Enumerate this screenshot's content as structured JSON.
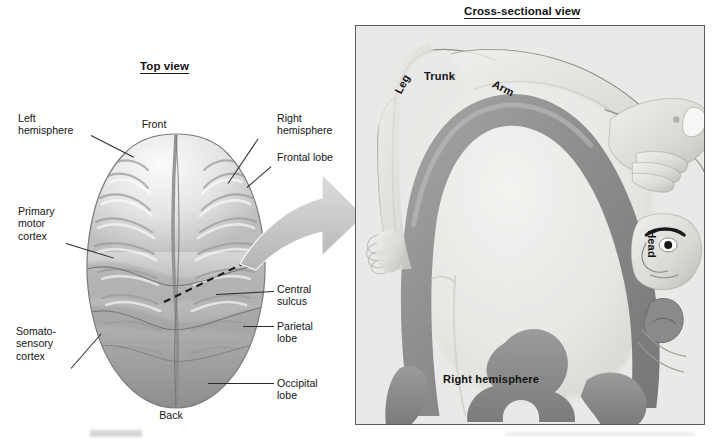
{
  "figure": {
    "kind": "anatomical-diagram"
  },
  "panels": {
    "top_view": {
      "title": "Top view",
      "orientation_labels": {
        "front": "Front",
        "back": "Back"
      },
      "callouts": [
        {
          "id": "left-hemisphere",
          "text": "Left\nhemisphere",
          "side": "left"
        },
        {
          "id": "primary-motor-cortex",
          "text": "Primary\nmotor\ncortex",
          "side": "left"
        },
        {
          "id": "somatosensory-cortex",
          "text": "Somato-\nsensory\ncortex",
          "side": "left"
        },
        {
          "id": "right-hemisphere",
          "text": "Right\nhemisphere",
          "side": "right"
        },
        {
          "id": "frontal-lobe",
          "text": "Frontal lobe",
          "side": "right"
        },
        {
          "id": "central-sulcus",
          "text": "Central\nsulcus",
          "side": "right"
        },
        {
          "id": "parietal-lobe",
          "text": "Parietal\nlobe",
          "side": "right"
        },
        {
          "id": "occipital-lobe",
          "text": "Occipital\nlobe",
          "side": "right"
        }
      ],
      "section_plane": "dashed cutting line across the right hemisphere"
    },
    "cross_section": {
      "title": "Cross-sectional view",
      "hemisphere_label": "Right\nhemisphere",
      "homunculus_labels": [
        {
          "id": "leg",
          "text": "Leg",
          "rotation_deg": -62
        },
        {
          "id": "trunk",
          "text": "Trunk",
          "rotation_deg": 0
        },
        {
          "id": "arm",
          "text": "Arm",
          "rotation_deg": 26
        },
        {
          "id": "head",
          "text": "Head",
          "rotation_deg": 90
        }
      ]
    }
  },
  "connector": {
    "id": "magnify-arrow",
    "shape": "curved-right-arrow"
  },
  "colors": {
    "page_background": "#ffffff",
    "panel_background": "#e9e9e7",
    "panel_border": "#5d5d5d",
    "text": "#141414",
    "leader_line": "#2a2a2a",
    "arrow_fill": "#c9c9c9",
    "cortex_band": "#8e8e8e",
    "brain_light": "#f2f2f2",
    "brain_dark": "#9a9a9a"
  }
}
